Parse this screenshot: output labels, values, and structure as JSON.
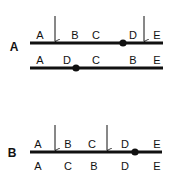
{
  "panels": [
    {
      "label": "A",
      "label_pos": [
        14,
        51
      ],
      "rows": [
        {
          "y": 43,
          "x1": 30,
          "x2": 163,
          "labels": [
            {
              "text": "A",
              "x": 40
            },
            {
              "text": "B",
              "x": 75
            },
            {
              "text": "C",
              "x": 96
            },
            {
              "text": "D",
              "x": 133
            },
            {
              "text": "E",
              "x": 157
            }
          ],
          "dot_x": 123,
          "arrows": [
            {
              "x": 55,
              "y1": 16
            },
            {
              "x": 144,
              "y1": 16
            }
          ]
        },
        {
          "y": 68,
          "x1": 30,
          "x2": 163,
          "labels": [
            {
              "text": "A",
              "x": 40
            },
            {
              "text": "D",
              "x": 67
            },
            {
              "text": "C",
              "x": 96
            },
            {
              "text": "B",
              "x": 133
            },
            {
              "text": "E",
              "x": 157
            }
          ],
          "dot_x": 76,
          "arrows": []
        }
      ]
    },
    {
      "label": "B",
      "label_pos": [
        12,
        157
      ],
      "rows": [
        {
          "y": 152,
          "x1": 30,
          "x2": 162,
          "labels": [
            {
              "text": "A",
              "x": 38
            },
            {
              "text": "B",
              "x": 68
            },
            {
              "text": "C",
              "x": 92
            },
            {
              "text": "D",
              "x": 125
            },
            {
              "text": "E",
              "x": 157
            }
          ],
          "dot_x": 135,
          "arrows": [
            {
              "x": 55,
              "y1": 125
            },
            {
              "x": 107,
              "y1": 125
            }
          ],
          "below_labels": [
            {
              "text": "A",
              "x": 38
            },
            {
              "text": "C",
              "x": 68
            },
            {
              "text": "B",
              "x": 94
            },
            {
              "text": "D",
              "x": 125
            },
            {
              "text": "E",
              "x": 157
            }
          ]
        }
      ]
    }
  ]
}
